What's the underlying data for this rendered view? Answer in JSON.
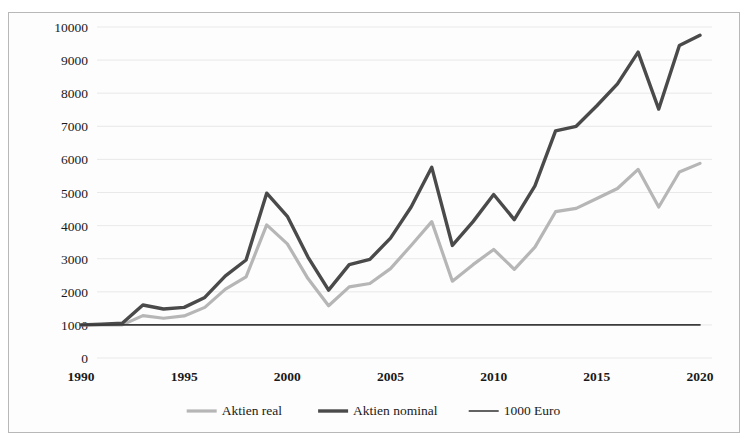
{
  "chart_data": {
    "type": "line",
    "title": "",
    "subtitle": "",
    "xlabel": "",
    "ylabel": "",
    "xlim": [
      1990,
      2020
    ],
    "ylim": [
      0,
      10000
    ],
    "grid": true,
    "legend_position": "bottom",
    "y_ticks": [
      0,
      1000,
      2000,
      3000,
      4000,
      5000,
      6000,
      7000,
      8000,
      9000,
      10000
    ],
    "y_tick_labels": [
      "0",
      "1000",
      "2000",
      "3000",
      "4000",
      "5000",
      "6000",
      "7000",
      "8000",
      "9000",
      "10000"
    ],
    "x_ticks": [
      1990,
      1995,
      2000,
      2005,
      2010,
      2015,
      2020
    ],
    "x_tick_labels": [
      "1990",
      "1995",
      "2000",
      "2005",
      "2010",
      "2015",
      "2020"
    ],
    "x": [
      1990,
      1991,
      1992,
      1993,
      1994,
      1995,
      1996,
      1997,
      1998,
      1999,
      2000,
      2001,
      2002,
      2003,
      2004,
      2005,
      2006,
      2007,
      2008,
      2009,
      2010,
      2011,
      2012,
      2013,
      2014,
      2015,
      2016,
      2017,
      2018,
      2019,
      2020
    ],
    "series": [
      {
        "name": "Aktien real",
        "color": "#b6b6b6",
        "width": 3.2,
        "values": [
          1000,
          1000,
          1000,
          1280,
          1200,
          1270,
          1530,
          2080,
          2450,
          4020,
          3450,
          2400,
          1580,
          2150,
          2250,
          2700,
          3400,
          4120,
          2320,
          2820,
          3280,
          2680,
          3350,
          4420,
          4520,
          4820,
          5120,
          5700,
          4560,
          5620,
          5880
        ]
      },
      {
        "name": "Aktien nominal",
        "color": "#4a4a4a",
        "width": 3.4,
        "values": [
          1000,
          1020,
          1050,
          1600,
          1480,
          1530,
          1830,
          2480,
          2960,
          4980,
          4280,
          3050,
          2050,
          2820,
          2980,
          3620,
          4560,
          5760,
          3400,
          4120,
          4940,
          4180,
          5200,
          6860,
          7000,
          7620,
          8280,
          9240,
          7520,
          9440,
          9750
        ]
      },
      {
        "name": "1000 Euro",
        "color": "#3c3c3c",
        "width": 1.6,
        "values": [
          1000,
          1000,
          1000,
          1000,
          1000,
          1000,
          1000,
          1000,
          1000,
          1000,
          1000,
          1000,
          1000,
          1000,
          1000,
          1000,
          1000,
          1000,
          1000,
          1000,
          1000,
          1000,
          1000,
          1000,
          1000,
          1000,
          1000,
          1000,
          1000,
          1000,
          1000
        ]
      }
    ]
  },
  "legend": {
    "items": [
      {
        "label": "Aktien real",
        "color": "#b6b6b6",
        "width": 3.2
      },
      {
        "label": "Aktien nominal",
        "color": "#4a4a4a",
        "width": 3.4
      },
      {
        "label": "1000 Euro",
        "color": "#3c3c3c",
        "width": 1.6
      }
    ]
  },
  "colors": {
    "background": "#ffffff",
    "frame_border": "#b8b8b8",
    "gridline": "#e3e3e3",
    "tick_text": "#1a1a1a"
  }
}
